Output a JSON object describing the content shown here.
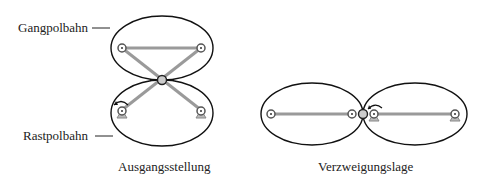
{
  "labels": {
    "gangpolbahn": "Gangpolbahn",
    "rastpolbahn": "Rastpolbahn",
    "caption_left": "Ausgangsstellung",
    "caption_right": "Verzweigungslage"
  },
  "colors": {
    "ellipse": "#111111",
    "link": "#9a9a9a",
    "joint": "#555555"
  }
}
